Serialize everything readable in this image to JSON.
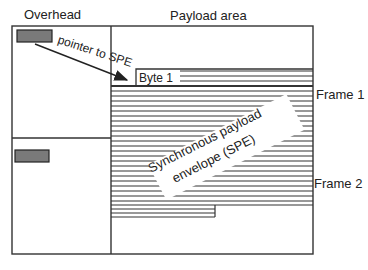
{
  "labels": {
    "overhead": "Overhead",
    "payload_area": "Payload area",
    "pointer": "pointer to SPE",
    "byte1": "Byte 1",
    "spe_line1": "Synchronous payload",
    "spe_line2": "envelope (SPE)",
    "frame1": "Frame 1",
    "frame2": "Frame 2"
  },
  "colors": {
    "line": "#333333",
    "pointer_fill": "#7a7a7a",
    "background": "#ffffff"
  }
}
